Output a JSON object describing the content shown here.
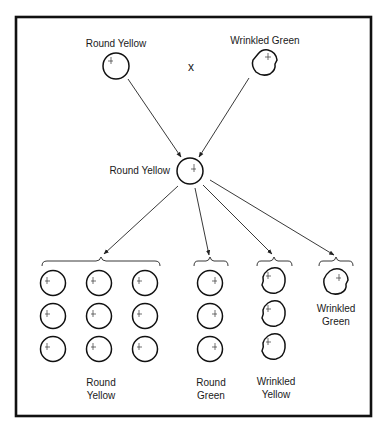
{
  "diagram": {
    "title": "",
    "cross_symbol": "x",
    "colors": {
      "ink": "#111111",
      "background": "#ffffff"
    },
    "parents": [
      {
        "id": "p1",
        "label": "Round Yellow",
        "shape": "round",
        "cx": 116,
        "cy": 66,
        "r": 13,
        "label_x": 116,
        "label_y": 44
      },
      {
        "id": "p2",
        "label": "Wrinkled Green",
        "shape": "wrinkled",
        "cx": 265,
        "cy": 63,
        "r": 13,
        "label_x": 265,
        "label_y": 44
      }
    ],
    "f1": {
      "id": "f1",
      "label": "Round Yellow",
      "shape": "round",
      "cx": 190,
      "cy": 171,
      "r": 13,
      "label_x": 169,
      "label_y": 174
    },
    "f2_groups": [
      {
        "id": "g1",
        "label_line1": "Round",
        "label_line2": "Yellow",
        "shape": "round",
        "count": 9,
        "label_x": 100,
        "brace": {
          "x1": 42,
          "x2": 160,
          "y": 263
        },
        "peas": [
          {
            "cx": 53,
            "cy": 283
          },
          {
            "cx": 99,
            "cy": 283
          },
          {
            "cx": 145,
            "cy": 283
          },
          {
            "cx": 53,
            "cy": 316
          },
          {
            "cx": 99,
            "cy": 316
          },
          {
            "cx": 145,
            "cy": 316
          },
          {
            "cx": 53,
            "cy": 349
          },
          {
            "cx": 99,
            "cy": 349
          },
          {
            "cx": 145,
            "cy": 349
          }
        ]
      },
      {
        "id": "g2",
        "label_line1": "Round",
        "label_line2": "Green",
        "shape": "round",
        "count": 3,
        "label_x": 211,
        "brace": {
          "x1": 194,
          "x2": 228,
          "y": 263
        },
        "peas": [
          {
            "cx": 210,
            "cy": 283
          },
          {
            "cx": 210,
            "cy": 316
          },
          {
            "cx": 210,
            "cy": 349
          }
        ]
      },
      {
        "id": "g3",
        "label_line1": "Wrinkled",
        "label_line2": "Yellow",
        "shape": "wrinkled",
        "count": 3,
        "label_x": 276,
        "brace": {
          "x1": 257,
          "x2": 292,
          "y": 263
        },
        "peas": [
          {
            "cx": 274,
            "cy": 281
          },
          {
            "cx": 274,
            "cy": 314
          },
          {
            "cx": 274,
            "cy": 347
          }
        ]
      },
      {
        "id": "g4",
        "label_line1": "Wrinkled",
        "label_line2": "Green",
        "shape": "wrinkled",
        "count": 1,
        "label_x": 336,
        "brace": {
          "x1": 319,
          "x2": 353,
          "y": 263
        },
        "peas": [
          {
            "cx": 336,
            "cy": 282
          }
        ]
      }
    ],
    "f2_ratio": "9:3:3:1"
  }
}
